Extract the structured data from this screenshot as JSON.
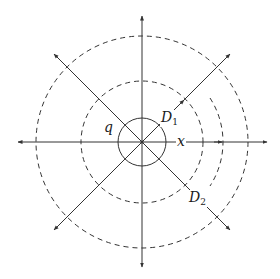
{
  "diagram": {
    "center": [
      142,
      142
    ],
    "labels": {
      "q": "q",
      "d1_main": "D",
      "d1_sub": "1",
      "d2_main": "D",
      "d2_sub": "2",
      "x": "x"
    },
    "circles": [
      {
        "name": "inner-circle",
        "r": 24,
        "style": "solid"
      },
      {
        "name": "dashed-circle-inner",
        "r": 61,
        "style": "dashed"
      },
      {
        "name": "dashed-circle-outer",
        "r": 106,
        "style": "dashed"
      }
    ],
    "partial_arc": {
      "r": 81,
      "style": "dashed",
      "side": "right"
    },
    "colors": {
      "stroke": "#333333",
      "background": "#ffffff"
    }
  }
}
